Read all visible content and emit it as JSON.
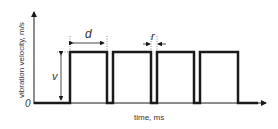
{
  "diagram": {
    "type": "pulse-waveform",
    "y_axis_label": "vibration velocity, m/s",
    "x_axis_label": "time, ms",
    "origin_label": "0",
    "amplitude_label": "v",
    "pulse_width_label": "d",
    "gap_label": "r",
    "pulses": [
      {
        "start": 70,
        "end": 107
      },
      {
        "start": 113,
        "end": 151
      },
      {
        "start": 157,
        "end": 194
      },
      {
        "start": 200,
        "end": 238
      }
    ],
    "colors": {
      "line": "#1a1a1a",
      "text": "#333333"
    }
  }
}
